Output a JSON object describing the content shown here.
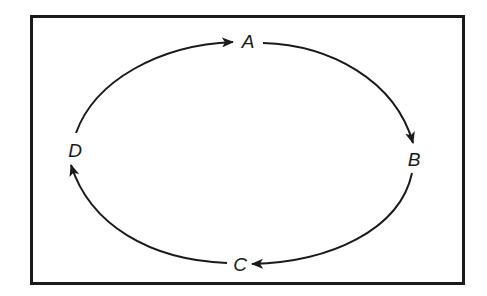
{
  "diagram": {
    "type": "cycle",
    "direction": "clockwise",
    "nodes": [
      {
        "id": "A",
        "label": "A",
        "x": 247,
        "y": 40
      },
      {
        "id": "B",
        "label": "B",
        "x": 413,
        "y": 158
      },
      {
        "id": "C",
        "label": "C",
        "x": 240,
        "y": 263
      },
      {
        "id": "D",
        "label": "D",
        "x": 75,
        "y": 150
      }
    ],
    "edges": [
      {
        "from": "A",
        "to": "B"
      },
      {
        "from": "B",
        "to": "C"
      },
      {
        "from": "C",
        "to": "D"
      },
      {
        "from": "D",
        "to": "A"
      }
    ],
    "colors": {
      "stroke": "#1a1a1a",
      "background": "#ffffff"
    }
  }
}
